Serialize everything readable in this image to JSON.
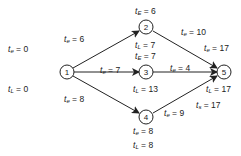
{
  "nodes": [
    {
      "id": "1",
      "x": 67,
      "y": 72
    },
    {
      "id": "2",
      "x": 146,
      "y": 27
    },
    {
      "id": "3",
      "x": 146,
      "y": 72
    },
    {
      "id": "4",
      "x": 146,
      "y": 117
    },
    {
      "id": "5",
      "x": 224,
      "y": 72
    }
  ],
  "edges": [
    {
      "from": "1",
      "to": "2"
    },
    {
      "from": "1",
      "to": "3"
    },
    {
      "from": "1",
      "to": "4"
    },
    {
      "from": "2",
      "to": "5"
    },
    {
      "from": "3",
      "to": "5"
    },
    {
      "from": "4",
      "to": "5"
    }
  ],
  "labels": {
    "n1_te": {
      "var": "t",
      "sub": "e",
      "value": "= 0"
    },
    "n1_tl": {
      "var": "t",
      "sub": "L",
      "value": "= 0"
    },
    "e12_te": {
      "var": "t",
      "sub": "e",
      "value": "= 6"
    },
    "e13_te": {
      "var": "t",
      "sub": "e",
      "value": "= 7"
    },
    "e14_te": {
      "var": "t",
      "sub": "e",
      "value": "= 8"
    },
    "n2_tE": {
      "var": "t",
      "sub": "E",
      "value": "= 6"
    },
    "n2_tL": {
      "var": "t",
      "sub": "L",
      "value": "= 7"
    },
    "n3_tE": {
      "var": "t",
      "sub": "E",
      "value": "= 7"
    },
    "n3_tL": {
      "var": "t",
      "sub": "L",
      "value": "= 13"
    },
    "e25_te": {
      "var": "t",
      "sub": "e",
      "value": "= 10"
    },
    "e35_te": {
      "var": "t",
      "sub": "e",
      "value": "= 4"
    },
    "e45_te": {
      "var": "t",
      "sub": "e",
      "value": "= 9"
    },
    "n4_te": {
      "var": "t",
      "sub": "e",
      "value": "= 8"
    },
    "n4_tL": {
      "var": "t",
      "sub": "L",
      "value": "= 8"
    },
    "n5_te": {
      "var": "t",
      "sub": "e",
      "value": "= 17"
    },
    "n5_tL": {
      "var": "t",
      "sub": "L",
      "value": "= 17"
    },
    "n5_ts": {
      "var": "t",
      "sub": "s",
      "value": "= 17"
    }
  }
}
